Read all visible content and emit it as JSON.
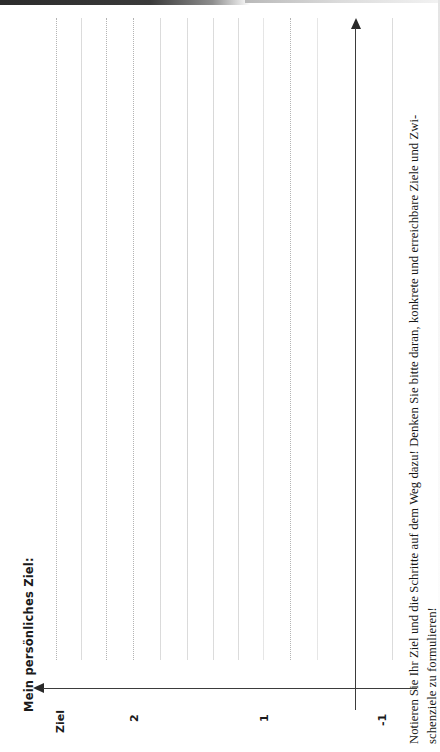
{
  "page": {
    "title": "Mein persönliches Ziel:",
    "orientation": "landscape-rotated-90ccw",
    "background_color": "#ffffff",
    "ink_color": "#1a1a1a",
    "rule_color": "#b4b4b4"
  },
  "axes": {
    "vertical_axis_name": "goal-axis",
    "horizontal_axis_name": "time-axis",
    "arrow_top_name": "arrow-up",
    "arrow_left_name": "arrow-left",
    "labels": [
      {
        "text": "Ziel",
        "name": "axis-label-ziel"
      },
      {
        "text": "2",
        "name": "axis-label-2"
      },
      {
        "text": "1",
        "name": "axis-label-1"
      },
      {
        "text": "-1",
        "name": "axis-label-minus-1"
      }
    ]
  },
  "instruction": {
    "line_1": "Notieren Sie Ihr Ziel und die Schritte auf dem Weg dazu! Denken Sie bitte daran, konkrete und erreichbare Ziele und Zwi-",
    "line_2": "schenziele zu formulieren!"
  },
  "writing_lines": {
    "count": 13,
    "note": "Blank dotted/faint ruled writing lines for handwritten entries"
  }
}
